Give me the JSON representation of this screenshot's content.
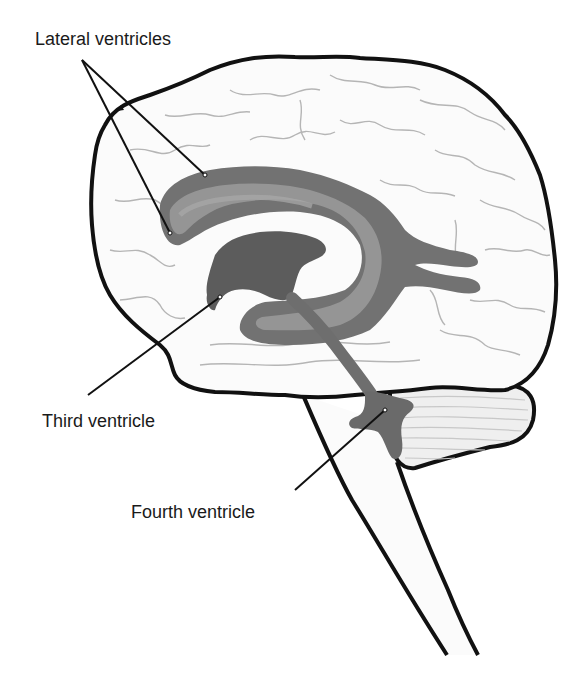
{
  "diagram": {
    "labels": {
      "lateral": "Lateral ventricles",
      "third": "Third ventricle",
      "fourth": "Fourth ventricle"
    },
    "colors": {
      "outline": "#111111",
      "sulci": "#b5b5b5",
      "brain_fill": "#fbfbfb",
      "ventricle_dark": "#6e6e6e",
      "ventricle_mid": "#8a8a8a",
      "ventricle_light": "#a3a3a3",
      "cerebellum_fill": "#efefef"
    }
  }
}
